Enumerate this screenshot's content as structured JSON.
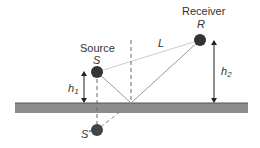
{
  "labels": {
    "source_title": "Source",
    "source_symbol": "S",
    "receiver_title": "Receiver",
    "receiver_symbol": "R",
    "distance": "L",
    "h1_base": "h",
    "h1_sub": "1",
    "h2_base": "h",
    "h2_sub": "2",
    "image_source": "S'"
  },
  "colors": {
    "ground": "#8c8c8c",
    "ground_edge": "#555555",
    "node": "#333333",
    "line": "#999999",
    "direct_path": "#cccccc",
    "arrow": "#222222"
  }
}
